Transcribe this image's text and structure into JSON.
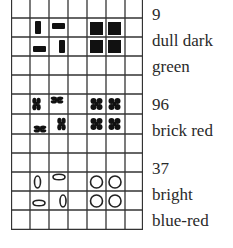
{
  "figure": {
    "grid": {
      "columns": 7,
      "rows": 12,
      "cell_size_px": 19,
      "top_open": true,
      "line_color": "#333333"
    },
    "blocks": [
      {
        "number": "9",
        "color_name_lines": [
          "dull dark",
          "green"
        ],
        "symbol": "rectangle",
        "symbol_fill": "#111111",
        "rows": [
          1,
          2
        ],
        "left_pair_shapes": [
          "vertical bar",
          "horizontal bar",
          "horizontal bar",
          "vertical bar"
        ],
        "right_pair_shapes": [
          "square",
          "square",
          "square",
          "square"
        ]
      },
      {
        "number": "96",
        "color_name_lines": [
          "brick red"
        ],
        "symbol": "four-lobed clover",
        "symbol_fill": "#111111",
        "rows": [
          5,
          6
        ],
        "left_pair_shapes": [
          "vertical clover",
          "horizontal clover",
          "horizontal clover",
          "vertical clover"
        ],
        "right_pair_shapes": [
          "clover",
          "clover",
          "clover",
          "clover"
        ]
      },
      {
        "number": "37",
        "color_name_lines": [
          "bright",
          "blue-red"
        ],
        "symbol": "ring",
        "symbol_fill": "none",
        "rows": [
          9,
          10
        ],
        "left_pair_shapes": [
          "vertical ellipse",
          "horizontal ellipse",
          "horizontal ellipse",
          "vertical ellipse"
        ],
        "right_pair_shapes": [
          "circle",
          "circle",
          "circle",
          "circle"
        ]
      }
    ]
  },
  "labels": {
    "b1_number": "9",
    "b1_line1": "dull dark",
    "b1_line2": "green",
    "b2_number": "96",
    "b2_line1": "brick red",
    "b3_number": "37",
    "b3_line1": "bright",
    "b3_line2": "blue-red"
  }
}
